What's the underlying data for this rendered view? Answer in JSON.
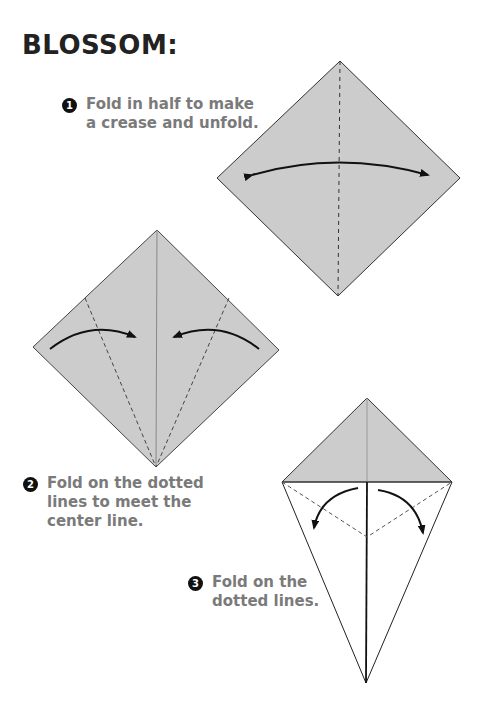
{
  "title": "BLOSSOM:",
  "colors": {
    "paper": "#cccccc",
    "text": "#7a7a7a",
    "title": "#222222",
    "badge": "#111111"
  },
  "steps": [
    {
      "number": "1",
      "lines": [
        "Fold in half to make",
        "a crease and unfold."
      ]
    },
    {
      "number": "2",
      "lines": [
        "Fold on the dotted",
        "lines to meet the",
        "center line."
      ]
    },
    {
      "number": "3",
      "lines": [
        "Fold on the",
        "dotted lines."
      ]
    }
  ]
}
